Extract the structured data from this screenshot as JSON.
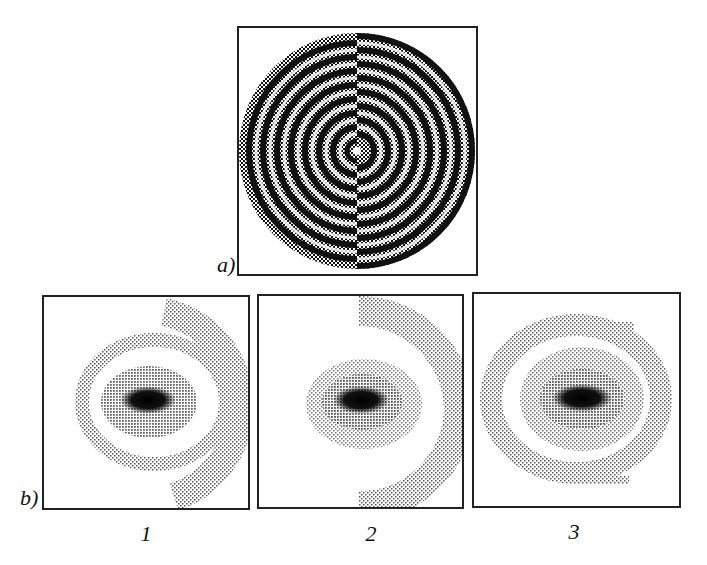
{
  "figure": {
    "panel_a": {
      "label": "a)",
      "description": "concentric ring phase pattern with half-plane phase shift",
      "ring_count": 9
    },
    "panel_b": {
      "label": "b)",
      "subpanels": [
        {
          "caption": "1",
          "description": "diffraction pattern with dark central elongated spot"
        },
        {
          "caption": "2",
          "description": "diffraction pattern with dark central elongated spot"
        },
        {
          "caption": "3",
          "description": "diffraction pattern with dark central elongated spot"
        }
      ]
    },
    "colors": {
      "ink": "#222222",
      "background": "#ffffff"
    }
  }
}
